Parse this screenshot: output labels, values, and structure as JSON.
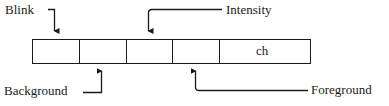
{
  "diagram": {
    "labels": {
      "blink": "Blink",
      "intensity": "Intensity",
      "background": "Background",
      "foreground": "Foreground"
    },
    "cells": [
      "",
      "",
      "",
      "",
      "ch"
    ],
    "colors": {
      "stroke": "#1a1a1a",
      "background": "#ffffff"
    }
  }
}
